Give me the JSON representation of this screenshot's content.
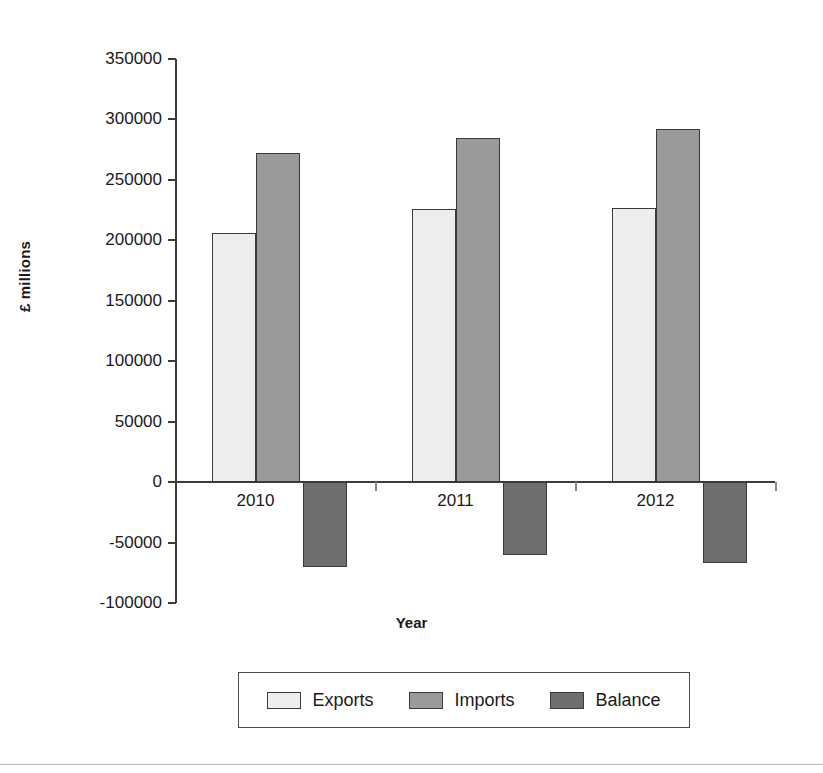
{
  "chart_data": {
    "type": "bar",
    "title": "",
    "xlabel": "Year",
    "ylabel": "£ millions",
    "categories": [
      "2010",
      "2011",
      "2012"
    ],
    "series": [
      {
        "name": "Exports",
        "color": "#ededed",
        "values": [
          206000,
          226000,
          227000
        ]
      },
      {
        "name": "Imports",
        "color": "#9a9a9a",
        "values": [
          272000,
          285000,
          292000
        ]
      },
      {
        "name": "Balance",
        "color": "#6e6e6e",
        "values": [
          -70000,
          -60000,
          -67000
        ]
      }
    ],
    "ylim": [
      -100000,
      350000
    ],
    "ytick_values": [
      350000,
      300000,
      250000,
      200000,
      150000,
      100000,
      50000,
      0,
      -50000,
      -100000
    ],
    "ytick_labels": [
      "350000",
      "300000",
      "250000",
      "200000",
      "150000",
      "100000",
      "50000",
      "0",
      "-50000",
      "-100000"
    ],
    "grid": false,
    "legend_position": "bottom"
  },
  "axes": {
    "y_title": "£ millions",
    "x_title": "Year"
  },
  "legend": {
    "entries": [
      {
        "label": "Exports"
      },
      {
        "label": "Imports"
      },
      {
        "label": "Balance"
      }
    ]
  }
}
